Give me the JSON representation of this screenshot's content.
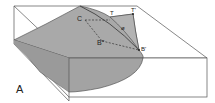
{
  "figure": {
    "panel_label": "A",
    "labels": {
      "c": "C",
      "t": "T",
      "t_prime": "T'",
      "phi": "ø",
      "b_double_prime": "B″",
      "b_prime": "B'"
    },
    "colors": {
      "surface_fill": "#a9a9a9",
      "surface_dark": "#8f8f8f",
      "box_outline": "#444444",
      "background": "#ffffff"
    }
  }
}
